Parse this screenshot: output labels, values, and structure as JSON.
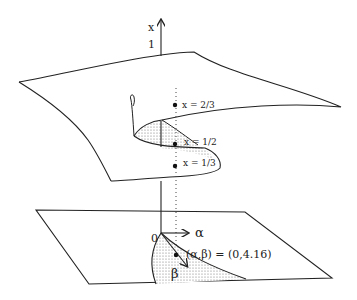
{
  "diagram": {
    "axis": {
      "vertical_label": "x",
      "vertical_tick": "1",
      "alpha_label": "α",
      "beta_label": "β",
      "origin_label": "0"
    },
    "points": [
      {
        "label": "x = 2/3"
      },
      {
        "label": "x = 1/2"
      },
      {
        "label": "x = 1/3"
      }
    ],
    "control_point": {
      "label": "(α,β) = (0,4.16)"
    },
    "colors": {
      "line": "#222222",
      "shade": "#bbbbbb",
      "background": "#ffffff"
    }
  }
}
